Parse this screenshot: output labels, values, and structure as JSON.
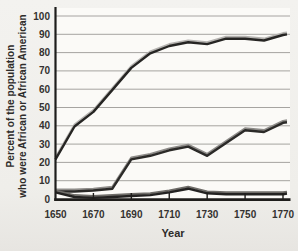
{
  "page": {
    "plot_bg": "#fbfaf7",
    "axis_color": "#1e1d1b",
    "grid_color": "#9c9a96",
    "tick_label_color": "#343230"
  },
  "chart_data": {
    "type": "line",
    "title": "",
    "xlabel": "Year",
    "ylabel": "Percent of the population who were African or African American",
    "ylabel_lines": [
      "Percent of the population",
      "who were African or African American"
    ],
    "x": [
      1650,
      1660,
      1670,
      1680,
      1690,
      1700,
      1710,
      1720,
      1730,
      1740,
      1750,
      1760,
      1770
    ],
    "x_ticks": [
      1650,
      1670,
      1690,
      1710,
      1730,
      1750,
      1770
    ],
    "y_ticks": [
      0,
      10,
      20,
      30,
      40,
      50,
      60,
      70,
      80,
      90,
      100
    ],
    "xlim": [
      1650,
      1770
    ],
    "ylim": [
      0,
      100
    ],
    "grid": true,
    "legend": false,
    "series": [
      {
        "name": "upper line",
        "values": [
          22,
          40,
          48,
          60,
          72,
          80,
          84,
          86,
          85,
          88,
          88,
          87,
          90
        ],
        "style": {
          "stroke": "#262523",
          "highlight": "#b5b3b0"
        }
      },
      {
        "name": "middle line",
        "values": [
          4.5,
          4.5,
          5,
          6,
          22,
          24,
          27,
          29,
          24,
          31,
          38,
          37,
          42
        ],
        "style": {
          "stroke": "#2b2a28",
          "highlight": "#8e8c89"
        }
      },
      {
        "name": "lower line",
        "values": [
          4,
          1.5,
          1,
          1.5,
          2,
          2.5,
          4,
          6,
          3.5,
          3,
          3,
          3,
          3
        ],
        "style": {
          "stroke": "#232221",
          "highlight": "#6f6d69"
        }
      }
    ]
  }
}
